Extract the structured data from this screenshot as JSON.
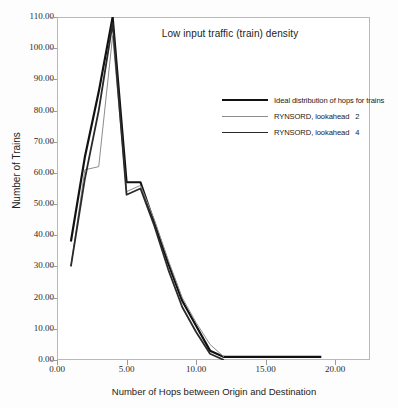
{
  "chart_data": {
    "type": "line",
    "title": "Low input traffic (train) density",
    "xlabel": "Number of Hops between Origin and Destination",
    "ylabel": "Number of Trains",
    "xlim": [
      0,
      22.5
    ],
    "ylim": [
      0,
      110
    ],
    "grid": false,
    "legend_position": "upper right",
    "xticks": [
      "0.00",
      "5.00",
      "10.00",
      "15.00",
      "20.00"
    ],
    "xtick_values": [
      0,
      5,
      10,
      15,
      20
    ],
    "yticks": [
      "0.00",
      "10.00",
      "20.00",
      "30.00",
      "40.00",
      "50.00",
      "60.00",
      "70.00",
      "80.00",
      "90.00",
      "100.00",
      "110.00"
    ],
    "ytick_values": [
      0,
      10,
      20,
      30,
      40,
      50,
      60,
      70,
      80,
      90,
      100,
      110
    ],
    "series": [
      {
        "name": "Ideal distribution of hops for trains",
        "color": "#111111",
        "width": 2.2,
        "x": [
          1,
          2,
          3,
          4,
          5,
          6,
          7,
          8,
          9,
          10,
          11,
          12,
          19
        ],
        "values": [
          38,
          65,
          86,
          110,
          57,
          57,
          44,
          31,
          19,
          11,
          3,
          1,
          1
        ]
      },
      {
        "name": "RYNSORD, lookahead",
        "lookahead": "2",
        "color": "#8d8d8d",
        "width": 1.0,
        "x": [
          1,
          2,
          3,
          4,
          5,
          6,
          7,
          8,
          9,
          10,
          11,
          12
        ],
        "values": [
          30,
          61,
          62,
          104,
          54,
          56,
          45,
          32,
          20,
          12,
          5,
          1
        ]
      },
      {
        "name": "RYNSORD, lookahead",
        "lookahead": "4",
        "color": "#2a2a2a",
        "width": 1.8,
        "x": [
          1,
          2,
          3,
          4,
          5,
          6,
          7,
          8,
          9,
          10,
          11,
          12
        ],
        "values": [
          30,
          58,
          80,
          108,
          53,
          55,
          43,
          29,
          17,
          9,
          2,
          0
        ]
      }
    ]
  },
  "legend": {
    "items": [
      {
        "label": "Ideal distribution of hops for trains",
        "num": ""
      },
      {
        "label": "RYNSORD, lookahead",
        "num": "2"
      },
      {
        "label": "RYNSORD, lookahead",
        "num": "4"
      }
    ]
  }
}
